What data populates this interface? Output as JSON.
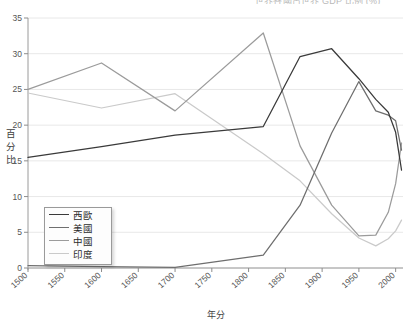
{
  "chart_data": {
    "type": "line",
    "title": "",
    "title_partial_cutoff": true,
    "xlabel": "年分",
    "ylabel": "百分比",
    "ylim": [
      0,
      35
    ],
    "xlim": [
      1500,
      2010
    ],
    "yticks": [
      0,
      5,
      10,
      15,
      20,
      25,
      30,
      35
    ],
    "xticks": [
      1500,
      1550,
      1600,
      1650,
      1700,
      1750,
      1800,
      1850,
      1900,
      1950,
      2000
    ],
    "grid": true,
    "grid_axis": "y",
    "legend_position": "lower-left",
    "series": [
      {
        "name": "西歐",
        "color": "#3a3a3a",
        "x": [
          1500,
          1600,
          1700,
          1820,
          1870,
          1913,
          1950,
          1973,
          1990,
          2000,
          2008
        ],
        "values": [
          15.5,
          17.0,
          18.6,
          19.8,
          29.6,
          30.7,
          26.5,
          23.6,
          21.8,
          19.0,
          13.7
        ]
      },
      {
        "name": "美國",
        "color": "#6e6e6e",
        "x": [
          1500,
          1600,
          1700,
          1820,
          1870,
          1913,
          1950,
          1973,
          1990,
          2000,
          2008
        ],
        "values": [
          0.32,
          0.2,
          0.1,
          1.8,
          8.8,
          18.9,
          26.1,
          22.0,
          21.4,
          20.6,
          16.5
        ]
      },
      {
        "name": "中國",
        "color": "#9b9b9b",
        "x": [
          1500,
          1600,
          1700,
          1820,
          1870,
          1913,
          1950,
          1973,
          1990,
          2000,
          2008
        ],
        "values": [
          25.0,
          28.7,
          22.0,
          32.9,
          17.1,
          8.8,
          4.5,
          4.6,
          7.8,
          11.8,
          17.5
        ]
      },
      {
        "name": "印度",
        "color": "#cacaca",
        "x": [
          1500,
          1600,
          1700,
          1820,
          1870,
          1913,
          1950,
          1973,
          1990,
          2000,
          2008
        ],
        "values": [
          24.5,
          22.4,
          24.4,
          16.0,
          12.2,
          7.6,
          4.2,
          3.1,
          4.1,
          5.2,
          6.7
        ]
      }
    ]
  },
  "legend": {
    "items": [
      {
        "label": "西歐",
        "color": "#3a3a3a"
      },
      {
        "label": "美國",
        "color": "#6e6e6e"
      },
      {
        "label": "中國",
        "color": "#9b9b9b"
      },
      {
        "label": "印度",
        "color": "#cacaca"
      }
    ]
  },
  "axes": {
    "y_label_chars": [
      "百",
      "分",
      "比"
    ],
    "x_label": "年分",
    "y_tick_labels": [
      "0",
      "5",
      "10",
      "15",
      "20",
      "25",
      "30",
      "35"
    ],
    "x_tick_labels": [
      "1500",
      "1550",
      "1600",
      "1650",
      "1700",
      "1750",
      "1800",
      "1850",
      "1900",
      "1950",
      "2000"
    ]
  },
  "title": {
    "cropped_text": "世界各國占世界 GDP 比例 (%)"
  }
}
